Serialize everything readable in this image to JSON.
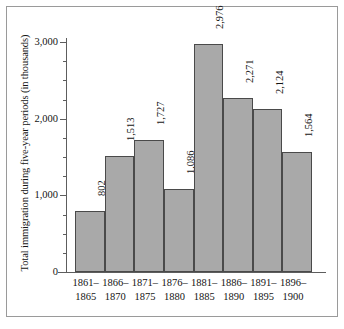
{
  "chart_data": {
    "type": "bar",
    "title": "",
    "xlabel": "",
    "ylabel": "Total immigration during five-year periods (in thousands)",
    "categories": [
      "1861–1865",
      "1866–1870",
      "1871–1875",
      "1876–1880",
      "1881–1885",
      "1886–1890",
      "1891–1895",
      "1896–1900"
    ],
    "category_lines": [
      [
        "1861–",
        "1865"
      ],
      [
        "1866–",
        "1870"
      ],
      [
        "1871–",
        "1875"
      ],
      [
        "1876–",
        "1880"
      ],
      [
        "1881–",
        "1885"
      ],
      [
        "1886–",
        "1890"
      ],
      [
        "1891–",
        "1895"
      ],
      [
        "1896–",
        "1900"
      ]
    ],
    "values": [
      802,
      1513,
      1727,
      1086,
      2976,
      2271,
      2124,
      1564
    ],
    "value_labels": [
      "802",
      "1,513",
      "1,727",
      "1,086",
      "2,976",
      "2,271",
      "2,124",
      "1,564"
    ],
    "ylim": [
      0,
      3000
    ],
    "ytick_labels": [
      "0",
      "1,000",
      "2,000",
      "3,000"
    ],
    "ytick_values": [
      0,
      1000,
      2000,
      3000
    ],
    "yminor_step": 250,
    "grid": false,
    "legend": null,
    "bar_color": "#a9a9a9",
    "bar_edge_color": "#4a4a4a",
    "axis_color": "#5d5d5d",
    "text_color": "#141414",
    "background_color": "#ffffff",
    "frame_color": "#9a9a9a"
  }
}
